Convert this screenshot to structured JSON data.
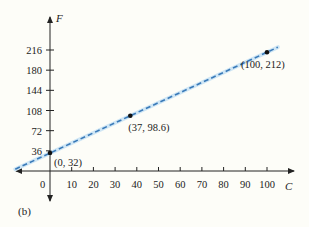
{
  "chart_data": {
    "type": "line",
    "title": "",
    "panel_label": "(b)",
    "xlabel": "C",
    "ylabel": "F",
    "x_ticks": [
      10,
      20,
      30,
      40,
      50,
      60,
      70,
      80,
      90,
      100
    ],
    "y_ticks": [
      36,
      72,
      108,
      144,
      180,
      216
    ],
    "origin_label": "0",
    "xlim": [
      -16,
      105
    ],
    "ylim": [
      -40,
      250
    ],
    "grid": false,
    "legend": null,
    "series": [
      {
        "name": "F = 1.8C + 32",
        "style": "dashed",
        "color": "#3a7ab8",
        "x": [
          -16,
          105
        ],
        "y": [
          3.2,
          221
        ]
      }
    ],
    "points": [
      {
        "x": 0,
        "y": 32,
        "label": "(0, 32)"
      },
      {
        "x": 37,
        "y": 98.6,
        "label": "(37, 98.6)"
      },
      {
        "x": 100,
        "y": 212,
        "label": "(100, 212)"
      }
    ],
    "colors": {
      "background": "#fdfdf8",
      "axis": "#222222",
      "line": "#3a7ab8",
      "line_halo": "#cfe6f5",
      "point": "#111111"
    }
  }
}
